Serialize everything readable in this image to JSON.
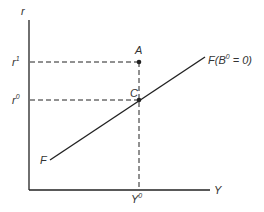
{
  "diagram": {
    "axes": {
      "y_label": "r",
      "x_label": "Y"
    },
    "ticks": {
      "r1": {
        "base": "r",
        "sup": "1"
      },
      "r0": {
        "base": "r",
        "sup": "0"
      },
      "Y0": {
        "base": "Y",
        "sup": "0"
      }
    },
    "points": {
      "A": "A",
      "C": "C"
    },
    "curve": {
      "start_label": "F",
      "end_label_base": "F(B",
      "end_label_sup": "0",
      "end_label_tail": " = 0)"
    },
    "colors": {
      "ink": "#222222",
      "background": "#ffffff"
    }
  }
}
